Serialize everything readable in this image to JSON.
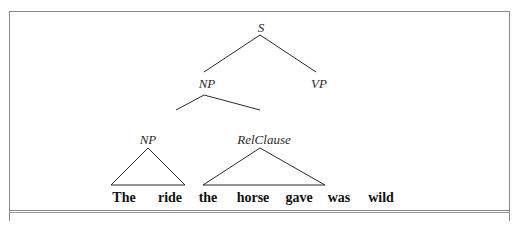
{
  "diagram": {
    "type": "syntax-tree",
    "nodes": {
      "root": "S",
      "np_top": "NP",
      "vp": "VP",
      "np_inner": "NP",
      "relclause": "RelClause"
    },
    "words": [
      "The",
      "ride",
      "the",
      "horse",
      "gave",
      "was",
      "wild"
    ],
    "structure": {
      "S": [
        "NP",
        "VP"
      ],
      "NP": [
        "NP",
        "RelClause"
      ],
      "NP_inner_span": [
        "The",
        "ride"
      ],
      "RelClause_span": [
        "the",
        "horse",
        "gave"
      ]
    },
    "line_color": "#2a2a2a"
  }
}
